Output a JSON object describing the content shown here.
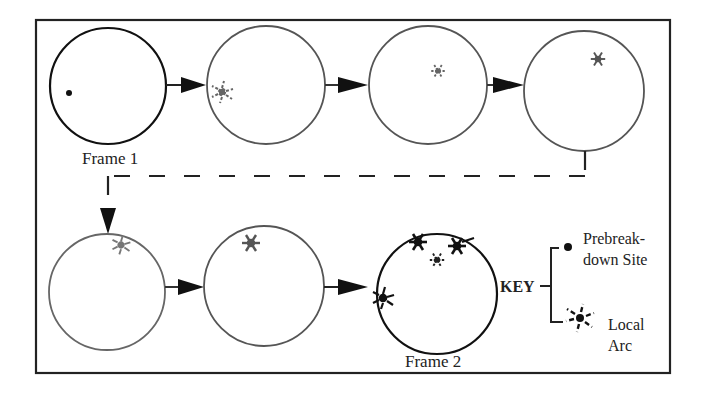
{
  "diagram": {
    "title": "",
    "frames": [
      {
        "id": 1,
        "label": "Frame 1",
        "cx": 108,
        "cy": 86,
        "r": 58,
        "stroke": "#111111",
        "stroke_width": 2.2
      },
      {
        "id": 2,
        "label": "",
        "cx": 266,
        "cy": 85,
        "r": 59,
        "stroke": "#555555",
        "stroke_width": 1.8
      },
      {
        "id": 3,
        "label": "",
        "cx": 428,
        "cy": 85,
        "r": 59,
        "stroke": "#555555",
        "stroke_width": 1.8
      },
      {
        "id": 4,
        "label": "",
        "cx": 584,
        "cy": 91,
        "r": 60,
        "stroke": "#555555",
        "stroke_width": 1.8
      },
      {
        "id": 5,
        "label": "",
        "cx": 107,
        "cy": 292,
        "r": 58,
        "stroke": "#666666",
        "stroke_width": 1.8
      },
      {
        "id": 6,
        "label": "",
        "cx": 264,
        "cy": 286,
        "r": 60,
        "stroke": "#555555",
        "stroke_width": 1.8
      },
      {
        "id": 7,
        "label": "Frame 2",
        "cx": 437,
        "cy": 294,
        "r": 60,
        "stroke": "#111111",
        "stroke_width": 2.2
      }
    ],
    "frame_labels": {
      "frame1": "Frame 1",
      "frame2": "Frame 2"
    },
    "key": {
      "title": "KEY",
      "items": [
        {
          "symbol": "dot",
          "label_line1": "Prebreak-",
          "label_line2": "down Site"
        },
        {
          "symbol": "star",
          "label_line1": "Local",
          "label_line2": "Arc"
        }
      ]
    },
    "colors": {
      "ink": "#111111",
      "faded_ink": "#666666",
      "background": "#ffffff"
    }
  }
}
